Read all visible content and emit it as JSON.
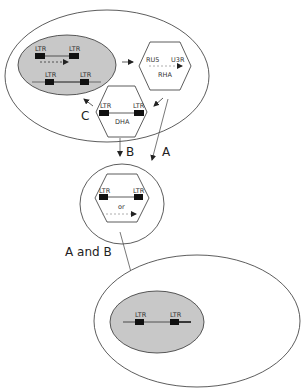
{
  "diagram": {
    "type": "retrovirus-life-cycle",
    "colors": {
      "stroke": "#333333",
      "nucleus_fill": "#c8c8c8",
      "ltr_box": "#111111",
      "rna_dash": "#999999",
      "host_dna": "#888888"
    },
    "top_cell": {
      "nucleus": {
        "provirus_ltr_left": "LTR",
        "provirus_ltr_right": "LTR",
        "integrated_ltr_left": "LTR",
        "integrated_ltr_right": "LTR"
      },
      "rha_particle": {
        "left_label": "RU5",
        "right_label": "U3R",
        "name": "RHA"
      },
      "dha_particle": {
        "ltr_left": "LTR",
        "ltr_right": "LTR",
        "name": "DHA"
      },
      "pathway_c_label": "C"
    },
    "pathways": {
      "a_label": "A",
      "b_label": "B",
      "a_and_b_label": "A and B"
    },
    "middle_particle": {
      "ltr_left": "LTR",
      "ltr_right": "LTR",
      "or_label": "or"
    },
    "bottom_cell": {
      "ltr_left": "LTR",
      "ltr_right": "LTR"
    }
  }
}
